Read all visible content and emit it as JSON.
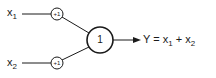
{
  "diagram": {
    "type": "perceptron",
    "inputs": [
      {
        "id": "x1",
        "label": "x",
        "subscript": "1",
        "weight": "+1"
      },
      {
        "id": "x2",
        "label": "x",
        "subscript": "2",
        "weight": "+1"
      }
    ],
    "neuron": {
      "label": "1"
    },
    "output": {
      "prefix": "Y = x",
      "sub1": "1",
      "mid": " + x",
      "sub2": "2"
    },
    "colors": {
      "stroke": "#1a1a1a",
      "background": "#ffffff"
    }
  }
}
